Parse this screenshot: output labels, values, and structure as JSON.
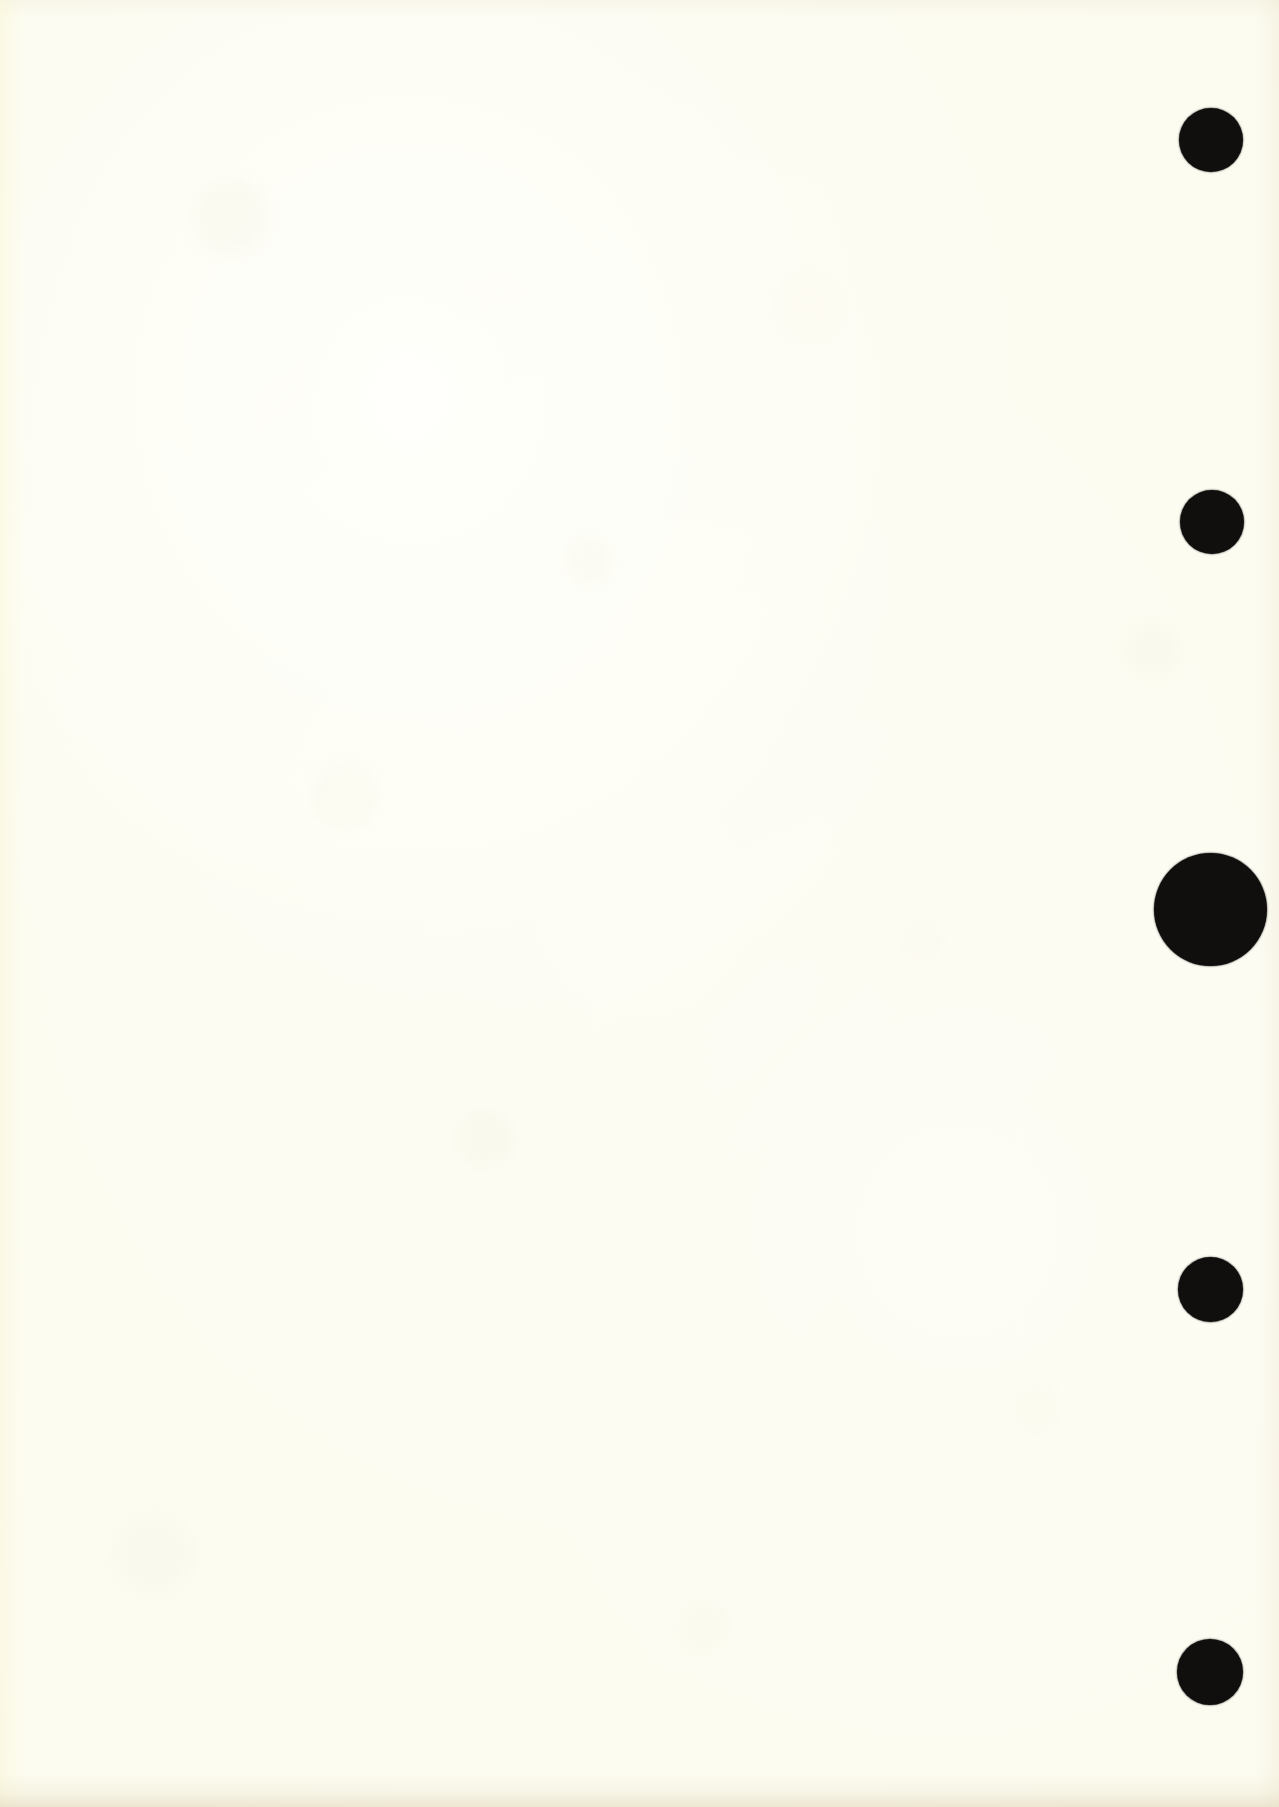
{
  "page": {
    "kind": "scanned-page",
    "width_px": 1279,
    "height_px": 1807,
    "background_color": "#fdfcf2",
    "paper_tone": "cream-ivory",
    "text_content": "",
    "visible_text": "none"
  },
  "marks": {
    "ink_color": "#100f0d",
    "count": 5,
    "alignment": "vertical-column-right-margin",
    "column_center_x_px": 1211,
    "items": [
      {
        "id": "dot-1",
        "label": "",
        "center_x_px": 1211,
        "center_y_px": 140,
        "diameter_px": 64,
        "size": "small"
      },
      {
        "id": "dot-2",
        "label": "",
        "center_x_px": 1212,
        "center_y_px": 522,
        "diameter_px": 64,
        "size": "small"
      },
      {
        "id": "dot-3",
        "label": "",
        "center_x_px": 1210,
        "center_y_px": 909,
        "diameter_px": 113,
        "size": "large"
      },
      {
        "id": "dot-4",
        "label": "",
        "center_x_px": 1210,
        "center_y_px": 1289,
        "diameter_px": 65,
        "size": "small"
      },
      {
        "id": "dot-5",
        "label": "",
        "center_x_px": 1210,
        "center_y_px": 1672,
        "diameter_px": 66,
        "size": "small"
      }
    ]
  },
  "chart_data": {
    "type": "scatter",
    "title": "",
    "subtitle": "",
    "xlabel": "",
    "ylabel": "",
    "grid": false,
    "legend": "none",
    "xlim": [
      0,
      1279
    ],
    "ylim": [
      0,
      1807
    ],
    "x": [
      1211,
      1212,
      1210,
      1210,
      1210
    ],
    "y": [
      140,
      522,
      909,
      1289,
      1672
    ],
    "sizes_px": [
      64,
      64,
      113,
      65,
      66
    ],
    "tick_labels_x": [],
    "tick_labels_y": [],
    "annotations": [],
    "series": [
      {
        "name": "marginal-dots",
        "color": "#100f0d",
        "values": [
          64,
          64,
          113,
          65,
          66
        ]
      }
    ]
  }
}
